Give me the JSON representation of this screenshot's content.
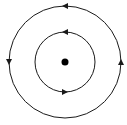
{
  "diagram": {
    "type": "concentric-circles-with-direction-arrows",
    "background": "#ffffff",
    "stroke_color": "#1a1a1a",
    "center": {
      "x": 65,
      "y": 62
    },
    "center_dot": {
      "radius": 3.5,
      "color": "#000000"
    },
    "circles": [
      {
        "name": "outer-circle",
        "radius": 56,
        "direction": "counter-clockwise",
        "arrows": [
          {
            "position": "top",
            "angle_deg": 270,
            "points": "left"
          },
          {
            "position": "left",
            "angle_deg": 180,
            "points": "down"
          },
          {
            "position": "right",
            "angle_deg": 0,
            "points": "up"
          }
        ]
      },
      {
        "name": "inner-circle",
        "radius": 30,
        "direction": "counter-clockwise",
        "arrows": [
          {
            "position": "top",
            "angle_deg": 270,
            "points": "left"
          },
          {
            "position": "bottom",
            "angle_deg": 90,
            "points": "right"
          }
        ]
      }
    ]
  }
}
